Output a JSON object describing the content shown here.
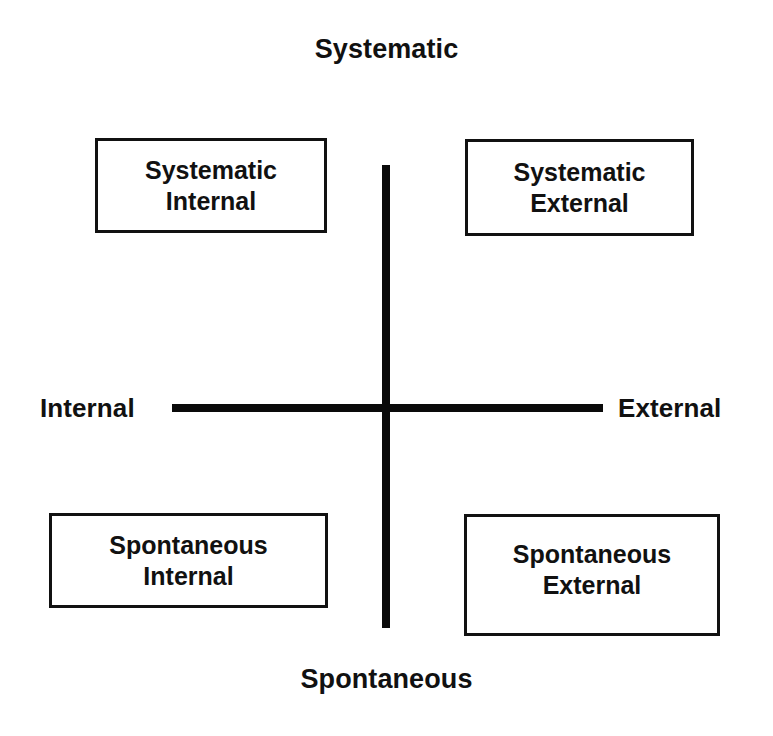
{
  "diagram": {
    "axes": {
      "vertical": {
        "top_label": "Systematic",
        "bottom_label": "Spontaneous"
      },
      "horizontal": {
        "left_label": "Internal",
        "right_label": "External"
      }
    },
    "quadrants": [
      {
        "id": "systematic-internal",
        "position": "top-left",
        "line1": "Systematic",
        "line2": "Internal",
        "text": "Systematic\nInternal"
      },
      {
        "id": "systematic-external",
        "position": "top-right",
        "line1": "Systematic",
        "line2": "External",
        "text": "Systematic\nExternal"
      },
      {
        "id": "spontaneous-internal",
        "position": "bottom-left",
        "line1": "Spontaneous",
        "line2": "Internal",
        "text": "Spontaneous\nInternal"
      },
      {
        "id": "spontaneous-external",
        "position": "bottom-right",
        "line1": "Spontaneous",
        "line2": "External",
        "text": "Spontaneous\nExternal"
      }
    ],
    "colors": {
      "background": "#ffffff",
      "stroke": "#111111",
      "axis": "#0a0a0a",
      "text": "#111111"
    }
  }
}
